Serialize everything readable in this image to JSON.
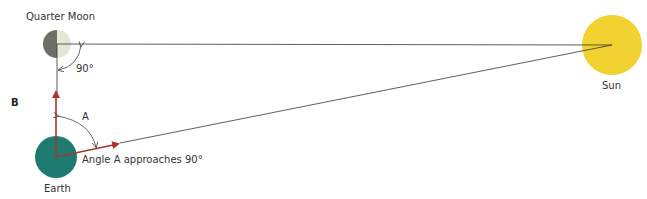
{
  "panel_label": "B",
  "bodies": {
    "moon": {
      "label": "Quarter Moon",
      "lit_color": "#E4E6D6",
      "dark_color": "#6E6F66"
    },
    "earth": {
      "label": "Earth",
      "color": "#1F7A72"
    },
    "sun": {
      "label": "Sun",
      "color": "#F2D230"
    }
  },
  "angles": {
    "right_angle_label": "90°",
    "angle_a_label": "A",
    "angle_a_caption": "Angle A approaches 90°"
  },
  "colors": {
    "arrow": "#A33A2A",
    "line": "#333333"
  }
}
